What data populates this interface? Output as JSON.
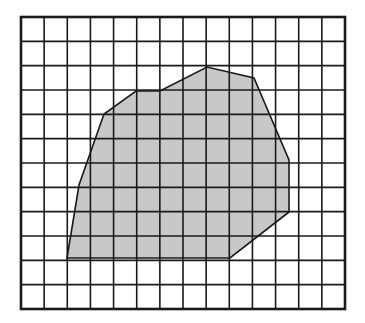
{
  "figure": {
    "width": 365,
    "height": 323,
    "background": "#ffffff"
  },
  "grid": {
    "left": 21,
    "top": 17,
    "right": 345,
    "bottom": 309,
    "columns": 14,
    "rows": 12,
    "line_color": "#1a1a1a",
    "line_width": 1.6,
    "border_width": 2.6
  },
  "shape": {
    "name": "irregular polygon",
    "fill": "#c8c8c8",
    "stroke": "#1a1a1a",
    "stroke_width": 1.6,
    "vertices": [
      [
        67,
        258
      ],
      [
        79,
        185
      ],
      [
        104,
        114
      ],
      [
        136,
        91
      ],
      [
        160,
        91
      ],
      [
        207,
        67
      ],
      [
        254,
        78
      ],
      [
        289,
        160
      ],
      [
        289,
        212
      ],
      [
        230,
        258
      ]
    ]
  }
}
